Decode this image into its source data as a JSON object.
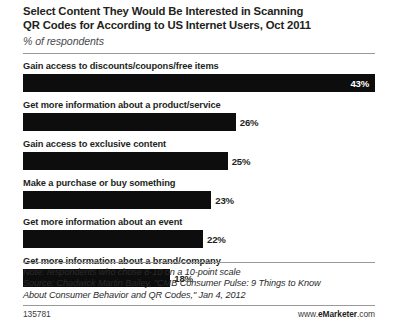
{
  "header": {
    "title_line1": "Select Content They Would Be Interested in Scanning",
    "title_line2": "QR Codes for According to US Internet Users, Oct 2011",
    "subtitle": "% of respondents"
  },
  "footer": {
    "note": "Note: respondents who chose 8-10 on a 10-point scale",
    "source_line1": "Source: Chadwick Martin Bailey, \"CMB Consumer Pulse: 9 Things to Know",
    "source_line2": "About Consumer Behavior and QR Codes,\" Jan 4, 2012",
    "chart_id": "135781",
    "brand_prefix": "www.",
    "brand_name": "eMarketer",
    "brand_suffix": ".com"
  },
  "chart_data": {
    "type": "bar",
    "orientation": "horizontal",
    "title": "Select Content They Would Be Interested in Scanning QR Codes for According to US Internet Users, Oct 2011",
    "subtitle": "% of respondents",
    "xlabel": "",
    "ylabel": "",
    "xlim": [
      0,
      43
    ],
    "grid": false,
    "legend": false,
    "value_suffix": "%",
    "bar_color": "#0d0d0d",
    "categories": [
      "Gain access to discounts/coupons/free items",
      "Get more information about a product/service",
      "Gain access to exclusive content",
      "Make a purchase or buy something",
      "Get more information about an event",
      "Get more information about a brand/company"
    ],
    "values": [
      43,
      26,
      25,
      23,
      22,
      18
    ],
    "value_labels": [
      "43%",
      "26%",
      "25%",
      "23%",
      "22%",
      "18%"
    ],
    "label_positions": [
      "inside",
      "outside",
      "outside",
      "outside",
      "outside",
      "outside"
    ],
    "bars": [
      {
        "label": "Gain access to discounts/coupons/free items",
        "value": 43,
        "value_label": "43%",
        "label_position": "inside"
      },
      {
        "label": "Get more information about a product/service",
        "value": 26,
        "value_label": "26%",
        "label_position": "outside"
      },
      {
        "label": "Gain access to exclusive content",
        "value": 25,
        "value_label": "25%",
        "label_position": "outside"
      },
      {
        "label": "Make a purchase or buy something",
        "value": 23,
        "value_label": "23%",
        "label_position": "outside"
      },
      {
        "label": "Get more information about an event",
        "value": 22,
        "value_label": "22%",
        "label_position": "outside"
      },
      {
        "label": "Get more information about a brand/company",
        "value": 18,
        "value_label": "18%",
        "label_position": "outside"
      }
    ],
    "note": "Note: respondents who chose 8-10 on a 10-point scale",
    "source": "Chadwick Martin Bailey, \"CMB Consumer Pulse: 9 Things to Know About Consumer Behavior and QR Codes,\" Jan 4, 2012"
  }
}
